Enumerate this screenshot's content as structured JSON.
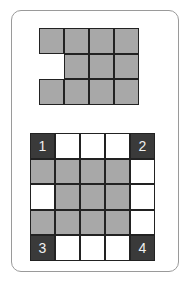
{
  "colors": {
    "gray": "#a8a8a8",
    "dark": "#3a3a3a",
    "white": "#ffffff",
    "border": "#222222"
  },
  "top_grid": {
    "rows": 3,
    "cols": 4,
    "cells": [
      [
        "gray",
        "gray",
        "gray",
        "gray"
      ],
      [
        "empty",
        "gray",
        "gray",
        "gray"
      ],
      [
        "gray",
        "gray",
        "gray",
        "gray"
      ]
    ]
  },
  "bottom_grid": {
    "rows": 5,
    "cols": 5,
    "cells": [
      [
        "dark",
        "white",
        "white",
        "white",
        "dark"
      ],
      [
        "gray",
        "gray",
        "gray",
        "gray",
        "white"
      ],
      [
        "white",
        "gray",
        "gray",
        "gray",
        "white"
      ],
      [
        "gray",
        "gray",
        "gray",
        "gray",
        "white"
      ],
      [
        "dark",
        "white",
        "white",
        "white",
        "dark"
      ]
    ],
    "labels": {
      "0,0": "1",
      "0,4": "2",
      "4,0": "3",
      "4,4": "4"
    }
  }
}
